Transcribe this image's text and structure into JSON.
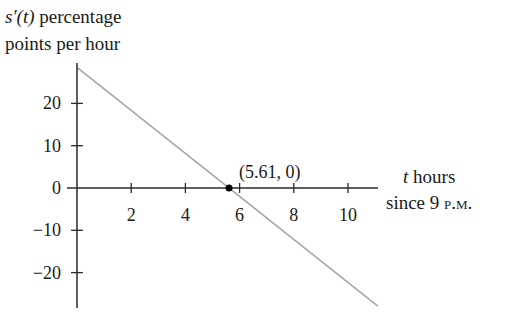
{
  "chart_data": {
    "type": "line",
    "title": "",
    "ylabel": {
      "func": "s′(t)",
      "line1_rest": " percentage",
      "line2": "points per hour"
    },
    "xlabel": {
      "var": "t",
      "line1_rest": " hours",
      "line2_prefix": "since 9 ",
      "line2_smallcaps": "p.m."
    },
    "x_ticks": [
      2,
      4,
      6,
      8,
      10
    ],
    "y_ticks": [
      20,
      10,
      0,
      -10,
      -20
    ],
    "y_tick_labels": [
      "20",
      "10",
      "0",
      "−10",
      "−20"
    ],
    "xlim": [
      0,
      11.1
    ],
    "ylim": [
      -28,
      28.5
    ],
    "grid": false,
    "legend": null,
    "series": [
      {
        "name": "s'(t)",
        "color": "#a6a6a6",
        "x": [
          0,
          11.1
        ],
        "y": [
          28.5,
          -27.9
        ]
      }
    ],
    "annotations": [
      {
        "type": "point",
        "x": 5.61,
        "y": 0,
        "label": "(5.61, 0)",
        "color": "#000000"
      }
    ]
  },
  "colors": {
    "axis": "#2a2a2a",
    "line": "#a6a6a6",
    "point": "#000000",
    "text": "#1a1a1a"
  }
}
